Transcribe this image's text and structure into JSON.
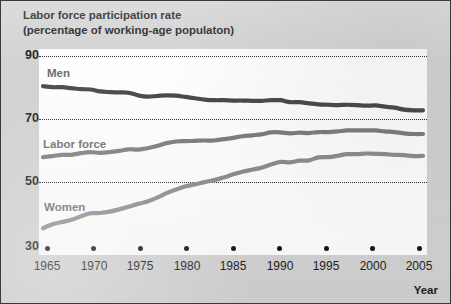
{
  "figure": {
    "title_line1": "Labor force participation rate",
    "title_line2": "(percentage of working-age populaton)"
  },
  "axes": {
    "y_ticks": [
      "90",
      "70",
      "50",
      "30"
    ],
    "x_ticks": [
      "1965",
      "1970",
      "1975",
      "1980",
      "1985",
      "1990",
      "1995",
      "2000",
      "2005"
    ],
    "x_axis_title": "Year"
  },
  "series_labels": {
    "men": "Men",
    "labor_force": "Labor force",
    "women": "Women"
  },
  "colors": {
    "men_line": "#4a4a4a",
    "labor_force_line": "#7d7d7d",
    "women_line": "#8d8d8d",
    "gridline": "#2a2a2a",
    "plot_background": "#fdfdfd",
    "page_background": "#d2d2d2",
    "border": "#3a3a3a",
    "label_text": "#6d6d6d",
    "axis_text": "#1d1d1d"
  },
  "chart_data": {
    "type": "line",
    "title": "Labor force participation rate (percentage of working-age populaton)",
    "xlabel": "Year",
    "ylabel": "",
    "xlim": [
      1965,
      2005
    ],
    "ylim": [
      30,
      90
    ],
    "yticks": [
      30,
      50,
      70,
      90
    ],
    "xticks": [
      1965,
      1970,
      1975,
      1980,
      1985,
      1990,
      1995,
      2000,
      2005
    ],
    "grid": "horizontal-dotted",
    "legend": "inline-labels",
    "x": [
      1965,
      1966,
      1967,
      1968,
      1969,
      1970,
      1971,
      1972,
      1973,
      1974,
      1975,
      1976,
      1977,
      1978,
      1979,
      1980,
      1981,
      1982,
      1983,
      1984,
      1985,
      1986,
      1987,
      1988,
      1989,
      1990,
      1991,
      1992,
      1993,
      1994,
      1995,
      1996,
      1997,
      1998,
      1999,
      2000,
      2001,
      2002,
      2003,
      2004,
      2005
    ],
    "series": [
      {
        "name": "Men",
        "color": "#4a4a4a",
        "values": [
          80.7,
          80.4,
          80.4,
          80.1,
          79.8,
          79.7,
          79.1,
          78.9,
          78.8,
          78.7,
          77.9,
          77.5,
          77.7,
          77.9,
          77.8,
          77.4,
          77.0,
          76.6,
          76.4,
          76.4,
          76.3,
          76.3,
          76.2,
          76.2,
          76.4,
          76.4,
          75.8,
          75.8,
          75.4,
          75.1,
          75.0,
          74.9,
          75.0,
          74.9,
          74.7,
          74.8,
          74.4,
          74.1,
          73.5,
          73.3,
          73.3
        ]
      },
      {
        "name": "Labor force",
        "color": "#7d7d7d",
        "values": [
          58.9,
          59.2,
          59.6,
          59.6,
          60.1,
          60.4,
          60.2,
          60.4,
          60.8,
          61.3,
          61.2,
          61.6,
          62.3,
          63.2,
          63.7,
          63.8,
          63.9,
          64.0,
          64.0,
          64.4,
          64.8,
          65.3,
          65.6,
          65.9,
          66.5,
          66.5,
          66.2,
          66.4,
          66.3,
          66.6,
          66.6,
          66.8,
          67.1,
          67.1,
          67.1,
          67.1,
          66.8,
          66.6,
          66.2,
          66.0,
          66.0
        ]
      },
      {
        "name": "Women",
        "color": "#8d8d8d",
        "values": [
          37.0,
          38.2,
          38.9,
          39.6,
          40.7,
          41.6,
          41.7,
          42.1,
          42.8,
          43.6,
          44.5,
          45.2,
          46.4,
          47.8,
          48.9,
          49.9,
          50.5,
          51.2,
          51.8,
          52.6,
          53.6,
          54.4,
          55.0,
          55.6,
          56.6,
          57.4,
          57.3,
          57.8,
          57.9,
          58.8,
          58.9,
          59.3,
          59.8,
          59.8,
          60.0,
          59.9,
          59.8,
          59.6,
          59.5,
          59.2,
          59.3
        ]
      }
    ]
  }
}
